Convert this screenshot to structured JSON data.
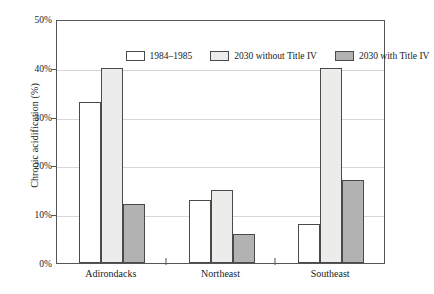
{
  "chart_data": {
    "type": "bar",
    "title": "",
    "xlabel": "",
    "ylabel": "Chronic acidification (%)",
    "categories": [
      "Adirondacks",
      "Northeast",
      "Southeast"
    ],
    "series": [
      {
        "name": "1984–1985",
        "values": [
          33,
          13,
          8
        ],
        "color": "#ffffff"
      },
      {
        "name": "2030 without Title IV",
        "values": [
          40,
          15,
          40
        ],
        "color": "#ececea"
      },
      {
        "name": "2030 with Title IV",
        "values": [
          12,
          6,
          17
        ],
        "color": "#b2b2b2"
      }
    ],
    "ylim": [
      0,
      50
    ],
    "yticks": [
      0,
      10,
      20,
      30,
      40,
      50
    ],
    "ytick_labels": [
      "0%",
      "10%",
      "20%",
      "30%",
      "40%",
      "50%"
    ],
    "grid": true,
    "legend_position": "top-inside"
  }
}
